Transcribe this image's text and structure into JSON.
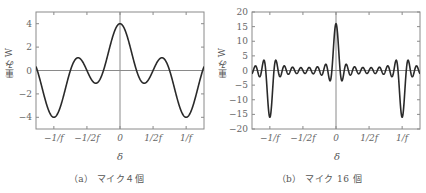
{
  "chart_data": [
    {
      "type": "line",
      "title": "（a） マイク４個",
      "xlabel": "δ",
      "ylabel": "重み W",
      "ylim": [
        -5,
        5
      ],
      "xlim": [
        -1.27,
        1.27
      ],
      "yticks": [
        -4,
        -2,
        0,
        2,
        4
      ],
      "ytick_labels": [
        "−4",
        "−2",
        "0",
        "2",
        "4"
      ],
      "xticks": [
        -1,
        -0.5,
        0,
        0.5,
        1
      ],
      "xtick_labels": [
        "−1/f",
        "−1/2f",
        "0",
        "1/2f",
        "1/f"
      ],
      "grid": false,
      "zero_lines": true,
      "function": "sin(N·π·f·δ)/sin(π·f·δ)",
      "N": 4,
      "x": [
        -1.25,
        -1.0,
        -0.83,
        -0.75,
        -0.5,
        -0.25,
        0,
        0.25,
        0.5,
        0.75,
        0.83,
        1.0,
        1.25
      ],
      "values": [
        0,
        -4,
        -1.1,
        0,
        0,
        0,
        4,
        0,
        0,
        0,
        -1.1,
        -4,
        0
      ],
      "key_points": {
        "peak_at_0": 4,
        "min_at_pm_1_over_f": -4,
        "side_max": 1.0,
        "side_min": -1.1
      }
    },
    {
      "type": "line",
      "title": "（b） マイク 16 個",
      "xlabel": "δ",
      "ylabel": "重み W",
      "ylim": [
        -20,
        20
      ],
      "xlim": [
        -1.27,
        1.27
      ],
      "yticks": [
        -20,
        -15,
        -10,
        -5,
        0,
        5,
        10,
        15,
        20
      ],
      "ytick_labels": [
        "−20",
        "−15",
        "−10",
        "−5",
        "0",
        "5",
        "10",
        "15",
        "20"
      ],
      "xticks": [
        -1,
        -0.5,
        0,
        0.5,
        1
      ],
      "xtick_labels": [
        "−1/f",
        "−1/2f",
        "0",
        "1/2f",
        "1/f"
      ],
      "grid": false,
      "zero_lines": true,
      "function": "sin(N·π·f·δ)/sin(π·f·δ)",
      "N": 16,
      "x": [
        -1.0,
        -0.5,
        0,
        0.5,
        1.0
      ],
      "values": [
        -16,
        0,
        16,
        0,
        -16
      ],
      "key_points": {
        "peak_at_0": 16,
        "min_at_pm_1_over_f": -16,
        "first_sidelobe": 3.5
      }
    }
  ],
  "panels": {
    "a": {
      "caption": "（a） マイク４個",
      "ylabel": "重み W",
      "xlabel": "δ"
    },
    "b": {
      "caption": "（b） マイク 16 個",
      "ylabel": "重み W",
      "xlabel": "δ"
    }
  },
  "colors": {
    "curve": "#2a2a2a",
    "axis_frame": "#8a8a8a",
    "zero_line": "#8a8a8a",
    "text": "#555555"
  }
}
